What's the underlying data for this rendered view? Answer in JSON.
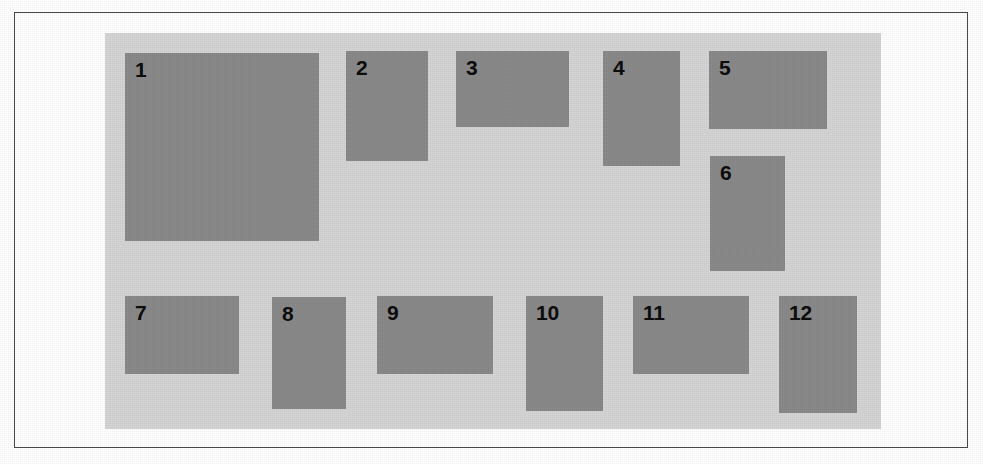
{
  "figure": {
    "canvas_width": 983,
    "canvas_height": 464,
    "page_background": "#ffffff",
    "frame": {
      "border_color": "#4a4a4a",
      "x": 14,
      "y": 12,
      "width": 954,
      "height": 436
    },
    "panel": {
      "background": "#d5d5d5",
      "x": 104,
      "y": 32,
      "width": 776,
      "height": 396
    },
    "block_fill": "#8a8a8a",
    "label_color": "#0d0d0d"
  },
  "blocks": [
    {
      "label": "1",
      "x": 124,
      "y": 52,
      "width": 194,
      "height": 188
    },
    {
      "label": "2",
      "x": 345,
      "y": 50,
      "width": 82,
      "height": 110
    },
    {
      "label": "3",
      "x": 455,
      "y": 50,
      "width": 113,
      "height": 76
    },
    {
      "label": "4",
      "x": 602,
      "y": 50,
      "width": 77,
      "height": 115
    },
    {
      "label": "5",
      "x": 708,
      "y": 50,
      "width": 118,
      "height": 78
    },
    {
      "label": "6",
      "x": 709,
      "y": 155,
      "width": 75,
      "height": 115
    },
    {
      "label": "7",
      "x": 124,
      "y": 295,
      "width": 114,
      "height": 78
    },
    {
      "label": "8",
      "x": 271,
      "y": 296,
      "width": 74,
      "height": 112
    },
    {
      "label": "9",
      "x": 376,
      "y": 295,
      "width": 116,
      "height": 78
    },
    {
      "label": "10",
      "x": 525,
      "y": 295,
      "width": 77,
      "height": 115
    },
    {
      "label": "11",
      "x": 632,
      "y": 295,
      "width": 116,
      "height": 78
    },
    {
      "label": "12",
      "x": 778,
      "y": 295,
      "width": 78,
      "height": 117
    }
  ]
}
